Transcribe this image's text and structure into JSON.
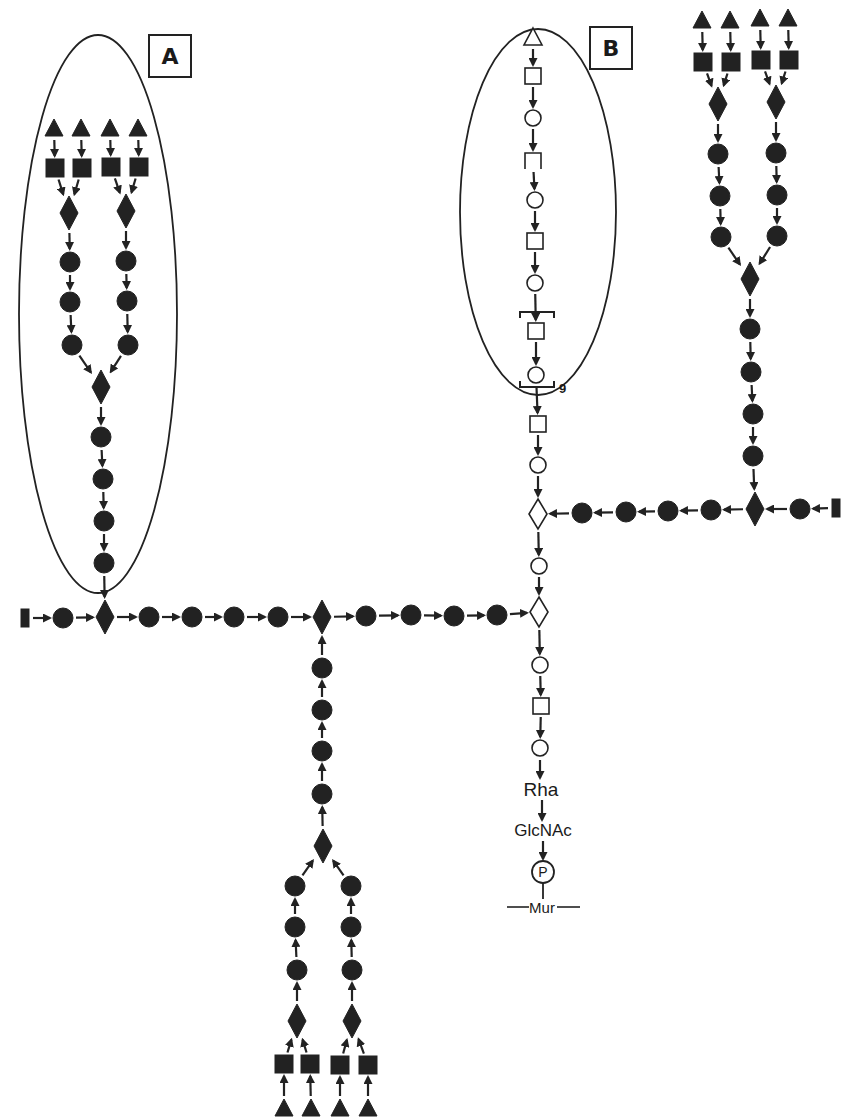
{
  "diagram": {
    "type": "glycan-structure",
    "ink_color": "#222222",
    "background": "#ffffff",
    "panel_labels": [
      {
        "id": "A",
        "label": "A",
        "x": 148,
        "y": 34,
        "w": 44,
        "h": 44
      },
      {
        "id": "B",
        "label": "B",
        "x": 589,
        "y": 26,
        "w": 44,
        "h": 44
      }
    ],
    "ellipses": [
      {
        "id": "ellipse-A",
        "cx": 98,
        "cy": 314,
        "rx": 79,
        "ry": 279
      },
      {
        "id": "ellipse-B",
        "cx": 538,
        "cy": 212,
        "rx": 78,
        "ry": 183
      }
    ],
    "legend_symbols": {
      "filled-triangle": "terminal residue (filled triangle)",
      "filled-square": "filled square residue",
      "filled-diamond": "branch residue (filled diamond)",
      "filled-circle": "filled circle residue",
      "open-triangle": "open triangle residue",
      "open-square": "open square residue",
      "open-circle": "open circle residue",
      "open-diamond": "open diamond residue",
      "filled-bar": "chain terminus bar"
    },
    "nodes": [
      {
        "id": "a_t1",
        "shape": "filled-triangle",
        "x": 54,
        "y": 128
      },
      {
        "id": "a_t2",
        "shape": "filled-triangle",
        "x": 81,
        "y": 128
      },
      {
        "id": "a_t3",
        "shape": "filled-triangle",
        "x": 110,
        "y": 128
      },
      {
        "id": "a_t4",
        "shape": "filled-triangle",
        "x": 138,
        "y": 128
      },
      {
        "id": "a_s1",
        "shape": "filled-square",
        "x": 55,
        "y": 168
      },
      {
        "id": "a_s2",
        "shape": "filled-square",
        "x": 82,
        "y": 168
      },
      {
        "id": "a_s3",
        "shape": "filled-square",
        "x": 111,
        "y": 167
      },
      {
        "id": "a_s4",
        "shape": "filled-square",
        "x": 139,
        "y": 167
      },
      {
        "id": "a_d1",
        "shape": "filled-diamond",
        "x": 69,
        "y": 213
      },
      {
        "id": "a_d2",
        "shape": "filled-diamond",
        "x": 126,
        "y": 211
      },
      {
        "id": "a_c1",
        "shape": "filled-circle",
        "x": 70,
        "y": 262
      },
      {
        "id": "a_c2",
        "shape": "filled-circle",
        "x": 70,
        "y": 302
      },
      {
        "id": "a_c3",
        "shape": "filled-circle",
        "x": 72,
        "y": 345
      },
      {
        "id": "a_c4",
        "shape": "filled-circle",
        "x": 126,
        "y": 261
      },
      {
        "id": "a_c5",
        "shape": "filled-circle",
        "x": 127,
        "y": 301
      },
      {
        "id": "a_c6",
        "shape": "filled-circle",
        "x": 128,
        "y": 345
      },
      {
        "id": "a_d3",
        "shape": "filled-diamond",
        "x": 101,
        "y": 387
      },
      {
        "id": "a_c7",
        "shape": "filled-circle",
        "x": 101,
        "y": 437
      },
      {
        "id": "a_c8",
        "shape": "filled-circle",
        "x": 103,
        "y": 479
      },
      {
        "id": "a_c9",
        "shape": "filled-circle",
        "x": 104,
        "y": 521
      },
      {
        "id": "a_c10",
        "shape": "filled-circle",
        "x": 104,
        "y": 563
      },
      {
        "id": "m_bar",
        "shape": "filled-bar",
        "x": 25,
        "y": 618
      },
      {
        "id": "m_c1",
        "shape": "filled-circle",
        "x": 63,
        "y": 618
      },
      {
        "id": "m_d1",
        "shape": "filled-diamond",
        "x": 105,
        "y": 617
      },
      {
        "id": "m_c2",
        "shape": "filled-circle",
        "x": 149,
        "y": 617
      },
      {
        "id": "m_c3",
        "shape": "filled-circle",
        "x": 192,
        "y": 617
      },
      {
        "id": "m_c4",
        "shape": "filled-circle",
        "x": 234,
        "y": 617
      },
      {
        "id": "m_c5",
        "shape": "filled-circle",
        "x": 278,
        "y": 617
      },
      {
        "id": "m_d2",
        "shape": "filled-diamond",
        "x": 322,
        "y": 617
      },
      {
        "id": "m_c6",
        "shape": "filled-circle",
        "x": 366,
        "y": 616
      },
      {
        "id": "m_c7",
        "shape": "filled-circle",
        "x": 411,
        "y": 615
      },
      {
        "id": "m_c8",
        "shape": "filled-circle",
        "x": 454,
        "y": 616
      },
      {
        "id": "m_c9",
        "shape": "filled-circle",
        "x": 497,
        "y": 615
      },
      {
        "id": "l_c1",
        "shape": "filled-circle",
        "x": 322,
        "y": 668
      },
      {
        "id": "l_c2",
        "shape": "filled-circle",
        "x": 322,
        "y": 710
      },
      {
        "id": "l_c3",
        "shape": "filled-circle",
        "x": 322,
        "y": 751
      },
      {
        "id": "l_c4",
        "shape": "filled-circle",
        "x": 322,
        "y": 794
      },
      {
        "id": "l_d1",
        "shape": "filled-diamond",
        "x": 323,
        "y": 846
      },
      {
        "id": "l_c5",
        "shape": "filled-circle",
        "x": 295,
        "y": 886
      },
      {
        "id": "l_c6",
        "shape": "filled-circle",
        "x": 295,
        "y": 927
      },
      {
        "id": "l_c7",
        "shape": "filled-circle",
        "x": 297,
        "y": 970
      },
      {
        "id": "l_c8",
        "shape": "filled-circle",
        "x": 351,
        "y": 886
      },
      {
        "id": "l_c9",
        "shape": "filled-circle",
        "x": 351,
        "y": 927
      },
      {
        "id": "l_c10",
        "shape": "filled-circle",
        "x": 352,
        "y": 970
      },
      {
        "id": "l_d2",
        "shape": "filled-diamond",
        "x": 297,
        "y": 1021
      },
      {
        "id": "l_d3",
        "shape": "filled-diamond",
        "x": 352,
        "y": 1021
      },
      {
        "id": "l_s1",
        "shape": "filled-square",
        "x": 284,
        "y": 1064
      },
      {
        "id": "l_s2",
        "shape": "filled-square",
        "x": 310,
        "y": 1064
      },
      {
        "id": "l_s3",
        "shape": "filled-square",
        "x": 340,
        "y": 1065
      },
      {
        "id": "l_s4",
        "shape": "filled-square",
        "x": 368,
        "y": 1065
      },
      {
        "id": "l_t1",
        "shape": "filled-triangle",
        "x": 284,
        "y": 1108
      },
      {
        "id": "l_t2",
        "shape": "filled-triangle",
        "x": 311,
        "y": 1108
      },
      {
        "id": "l_t3",
        "shape": "filled-triangle",
        "x": 340,
        "y": 1108
      },
      {
        "id": "l_t4",
        "shape": "filled-triangle",
        "x": 368,
        "y": 1108
      },
      {
        "id": "b_t0",
        "shape": "open-triangle",
        "x": 533,
        "y": 37
      },
      {
        "id": "b_s1",
        "shape": "open-square",
        "x": 533,
        "y": 76
      },
      {
        "id": "b_c1",
        "shape": "open-circle",
        "x": 533,
        "y": 118
      },
      {
        "id": "b_s2",
        "shape": "open-bracket-square",
        "x": 533,
        "y": 161
      },
      {
        "id": "b_c2",
        "shape": "open-circle",
        "x": 535,
        "y": 200
      },
      {
        "id": "b_s3",
        "shape": "open-square",
        "x": 535,
        "y": 241
      },
      {
        "id": "b_c3",
        "shape": "open-circle",
        "x": 535,
        "y": 283
      },
      {
        "id": "b_s4",
        "shape": "open-square",
        "x": 536,
        "y": 331
      },
      {
        "id": "b_c4",
        "shape": "open-circle",
        "x": 536,
        "y": 375
      },
      {
        "id": "b_s5",
        "shape": "open-square",
        "x": 538,
        "y": 424
      },
      {
        "id": "b_c5",
        "shape": "open-circle",
        "x": 538,
        "y": 465
      },
      {
        "id": "b_d1",
        "shape": "open-diamond",
        "x": 538,
        "y": 514
      },
      {
        "id": "b_c6",
        "shape": "open-circle",
        "x": 539,
        "y": 566
      },
      {
        "id": "b_d2",
        "shape": "open-diamond",
        "x": 539,
        "y": 612
      },
      {
        "id": "b_c7",
        "shape": "open-circle",
        "x": 540,
        "y": 665
      },
      {
        "id": "b_s6",
        "shape": "open-square",
        "x": 541,
        "y": 706
      },
      {
        "id": "b_c8",
        "shape": "open-circle",
        "x": 540,
        "y": 748
      },
      {
        "id": "r_t1",
        "shape": "filled-triangle",
        "x": 702,
        "y": 20
      },
      {
        "id": "r_t2",
        "shape": "filled-triangle",
        "x": 730,
        "y": 20
      },
      {
        "id": "r_t3",
        "shape": "filled-triangle",
        "x": 760,
        "y": 18
      },
      {
        "id": "r_t4",
        "shape": "filled-triangle",
        "x": 788,
        "y": 18
      },
      {
        "id": "r_s1",
        "shape": "filled-square",
        "x": 703,
        "y": 62
      },
      {
        "id": "r_s2",
        "shape": "filled-square",
        "x": 731,
        "y": 62
      },
      {
        "id": "r_s3",
        "shape": "filled-square",
        "x": 761,
        "y": 60
      },
      {
        "id": "r_s4",
        "shape": "filled-square",
        "x": 789,
        "y": 60
      },
      {
        "id": "r_d1",
        "shape": "filled-diamond",
        "x": 718,
        "y": 104
      },
      {
        "id": "r_d2",
        "shape": "filled-diamond",
        "x": 776,
        "y": 102
      },
      {
        "id": "r_c1",
        "shape": "filled-circle",
        "x": 718,
        "y": 154
      },
      {
        "id": "r_c2",
        "shape": "filled-circle",
        "x": 720,
        "y": 196
      },
      {
        "id": "r_c3",
        "shape": "filled-circle",
        "x": 721,
        "y": 237
      },
      {
        "id": "r_c4",
        "shape": "filled-circle",
        "x": 776,
        "y": 153
      },
      {
        "id": "r_c5",
        "shape": "filled-circle",
        "x": 777,
        "y": 195
      },
      {
        "id": "r_c6",
        "shape": "filled-circle",
        "x": 777,
        "y": 236
      },
      {
        "id": "r_d3",
        "shape": "filled-diamond",
        "x": 750,
        "y": 279
      },
      {
        "id": "r_c7",
        "shape": "filled-circle",
        "x": 750,
        "y": 329
      },
      {
        "id": "r_c8",
        "shape": "filled-circle",
        "x": 751,
        "y": 372
      },
      {
        "id": "r_c9",
        "shape": "filled-circle",
        "x": 753,
        "y": 414
      },
      {
        "id": "r_c10",
        "shape": "filled-circle",
        "x": 753,
        "y": 456
      },
      {
        "id": "r_d4",
        "shape": "filled-diamond",
        "x": 755,
        "y": 509
      },
      {
        "id": "r_c11",
        "shape": "filled-circle",
        "x": 800,
        "y": 509
      },
      {
        "id": "r_bar",
        "shape": "filled-bar",
        "x": 836,
        "y": 508
      },
      {
        "id": "r_c12",
        "shape": "filled-circle",
        "x": 711,
        "y": 510
      },
      {
        "id": "r_c13",
        "shape": "filled-circle",
        "x": 668,
        "y": 511
      },
      {
        "id": "r_c14",
        "shape": "filled-circle",
        "x": 626,
        "y": 512
      },
      {
        "id": "r_c15",
        "shape": "filled-circle",
        "x": 582,
        "y": 513
      }
    ],
    "brackets": [
      {
        "id": "repeat-bracket-top",
        "x": 537,
        "y": 312,
        "type": "top"
      },
      {
        "id": "repeat-bracket-bottom",
        "x": 537,
        "y": 387,
        "type": "bottom",
        "subscript": "9"
      }
    ],
    "text_nodes": [
      {
        "id": "rha",
        "label": "Rha",
        "x": 541,
        "y": 790,
        "size": 19
      },
      {
        "id": "glcnac",
        "label": "GlcNAc",
        "x": 543,
        "y": 831,
        "size": 17
      },
      {
        "id": "mur",
        "label": "Mur",
        "x": 542,
        "y": 907,
        "size": 15
      }
    ],
    "phosphate": {
      "label": "P",
      "x": 543,
      "y": 872,
      "r": 11
    },
    "mur_line": {
      "x1": 507,
      "x2": 580,
      "y": 907,
      "gap_left": 529,
      "gap_right": 557
    },
    "edges": [
      [
        "a_t1",
        "a_s1"
      ],
      [
        "a_t2",
        "a_s2"
      ],
      [
        "a_t3",
        "a_s3"
      ],
      [
        "a_t4",
        "a_s4"
      ],
      [
        "a_s1",
        "a_d1"
      ],
      [
        "a_s2",
        "a_d1"
      ],
      [
        "a_s3",
        "a_d2"
      ],
      [
        "a_s4",
        "a_d2"
      ],
      [
        "a_d1",
        "a_c1"
      ],
      [
        "a_c1",
        "a_c2"
      ],
      [
        "a_c2",
        "a_c3"
      ],
      [
        "a_d2",
        "a_c4"
      ],
      [
        "a_c4",
        "a_c5"
      ],
      [
        "a_c5",
        "a_c6"
      ],
      [
        "a_c3",
        "a_d3"
      ],
      [
        "a_c6",
        "a_d3"
      ],
      [
        "a_d3",
        "a_c7"
      ],
      [
        "a_c7",
        "a_c8"
      ],
      [
        "a_c8",
        "a_c9"
      ],
      [
        "a_c9",
        "a_c10"
      ],
      [
        "a_c10",
        "m_d1"
      ],
      [
        "m_bar",
        "m_c1"
      ],
      [
        "m_c1",
        "m_d1"
      ],
      [
        "m_d1",
        "m_c2"
      ],
      [
        "m_c2",
        "m_c3"
      ],
      [
        "m_c3",
        "m_c4"
      ],
      [
        "m_c4",
        "m_c5"
      ],
      [
        "m_c5",
        "m_d2"
      ],
      [
        "m_d2",
        "m_c6"
      ],
      [
        "m_c6",
        "m_c7"
      ],
      [
        "m_c7",
        "m_c8"
      ],
      [
        "m_c8",
        "m_c9"
      ],
      [
        "m_c9",
        "b_d2"
      ],
      [
        "l_c1",
        "m_d2"
      ],
      [
        "l_c2",
        "l_c1"
      ],
      [
        "l_c3",
        "l_c2"
      ],
      [
        "l_c4",
        "l_c3"
      ],
      [
        "l_d1",
        "l_c4"
      ],
      [
        "l_c5",
        "l_d1"
      ],
      [
        "l_c8",
        "l_d1"
      ],
      [
        "l_c6",
        "l_c5"
      ],
      [
        "l_c7",
        "l_c6"
      ],
      [
        "l_c9",
        "l_c8"
      ],
      [
        "l_c10",
        "l_c9"
      ],
      [
        "l_d2",
        "l_c7"
      ],
      [
        "l_d3",
        "l_c10"
      ],
      [
        "l_s1",
        "l_d2"
      ],
      [
        "l_s2",
        "l_d2"
      ],
      [
        "l_s3",
        "l_d3"
      ],
      [
        "l_s4",
        "l_d3"
      ],
      [
        "l_t1",
        "l_s1"
      ],
      [
        "l_t2",
        "l_s2"
      ],
      [
        "l_t3",
        "l_s3"
      ],
      [
        "l_t4",
        "l_s4"
      ],
      [
        "b_t0",
        "b_s1"
      ],
      [
        "b_s1",
        "b_c1"
      ],
      [
        "b_c1",
        "b_s2"
      ],
      [
        "b_s2",
        "b_c2"
      ],
      [
        "b_c2",
        "b_s3"
      ],
      [
        "b_s3",
        "b_c3"
      ],
      [
        "b_c3",
        "b_s4"
      ],
      [
        "b_s4",
        "b_c4"
      ],
      [
        "b_c4",
        "b_s5"
      ],
      [
        "b_s5",
        "b_c5"
      ],
      [
        "b_c5",
        "b_d1"
      ],
      [
        "b_d1",
        "b_c6"
      ],
      [
        "b_c6",
        "b_d2"
      ],
      [
        "b_d2",
        "b_c7"
      ],
      [
        "b_c7",
        "b_s6"
      ],
      [
        "b_s6",
        "b_c8"
      ],
      [
        "r_t1",
        "r_s1"
      ],
      [
        "r_t2",
        "r_s2"
      ],
      [
        "r_t3",
        "r_s3"
      ],
      [
        "r_t4",
        "r_s4"
      ],
      [
        "r_s1",
        "r_d1"
      ],
      [
        "r_s2",
        "r_d1"
      ],
      [
        "r_s3",
        "r_d2"
      ],
      [
        "r_s4",
        "r_d2"
      ],
      [
        "r_d1",
        "r_c1"
      ],
      [
        "r_c1",
        "r_c2"
      ],
      [
        "r_c2",
        "r_c3"
      ],
      [
        "r_d2",
        "r_c4"
      ],
      [
        "r_c4",
        "r_c5"
      ],
      [
        "r_c5",
        "r_c6"
      ],
      [
        "r_c3",
        "r_d3"
      ],
      [
        "r_c6",
        "r_d3"
      ],
      [
        "r_d3",
        "r_c7"
      ],
      [
        "r_c7",
        "r_c8"
      ],
      [
        "r_c8",
        "r_c9"
      ],
      [
        "r_c9",
        "r_c10"
      ],
      [
        "r_c10",
        "r_d4"
      ],
      [
        "r_bar",
        "r_c11"
      ],
      [
        "r_c11",
        "r_d4"
      ],
      [
        "r_d4",
        "r_c12"
      ],
      [
        "r_c12",
        "r_c13"
      ],
      [
        "r_c13",
        "r_c14"
      ],
      [
        "r_c14",
        "r_c15"
      ],
      [
        "r_c15",
        "b_d1"
      ]
    ],
    "text_edges": [
      {
        "x": 540,
        "y1": 760,
        "y2": 778
      },
      {
        "x": 542,
        "y1": 800,
        "y2": 820
      },
      {
        "x": 543,
        "y1": 841,
        "y2": 859
      }
    ]
  }
}
